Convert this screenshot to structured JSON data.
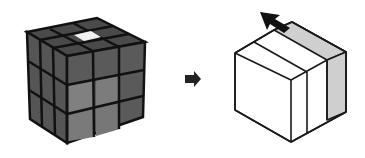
{
  "diagram": {
    "left_cube": {
      "label": "rubiks-cube",
      "grid": "3x3x3",
      "sticker_color": "#4a4a4a",
      "front_face_highlight_color": "#777777",
      "highlight_sticker_color": "#f2f2f2",
      "edge_color": "#111111"
    },
    "transition_arrow": {
      "direction": "right",
      "color": "#222222"
    },
    "right_cube": {
      "label": "cube-slice-diagram",
      "face_color": "#ffffff",
      "slab_color": "#cfcfcf",
      "line_color": "#1a1a1a",
      "rotation_arrow": {
        "direction": "up-left",
        "color": "#111111"
      }
    }
  }
}
